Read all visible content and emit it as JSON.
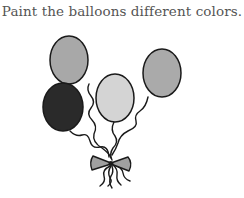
{
  "instruction": "Paint the balloons different colors.",
  "illustration": {
    "name": "balloon-bunch",
    "outline_color": "#1a1a1a",
    "balloons": [
      {
        "id": "balloon-top-left",
        "cx": 69,
        "cy": 60,
        "rx": 19,
        "ry": 24,
        "fill": "#a8a8a8"
      },
      {
        "id": "balloon-left-dark",
        "cx": 63,
        "cy": 107,
        "rx": 20,
        "ry": 24,
        "fill": "#2a2a2a"
      },
      {
        "id": "balloon-middle-light",
        "cx": 115,
        "cy": 98,
        "rx": 19,
        "ry": 24,
        "fill": "#d4d4d4"
      },
      {
        "id": "balloon-right",
        "cx": 162,
        "cy": 73,
        "rx": 19,
        "ry": 24,
        "fill": "#aaaaaa"
      }
    ],
    "bow_fill": "#a0a0a0"
  }
}
